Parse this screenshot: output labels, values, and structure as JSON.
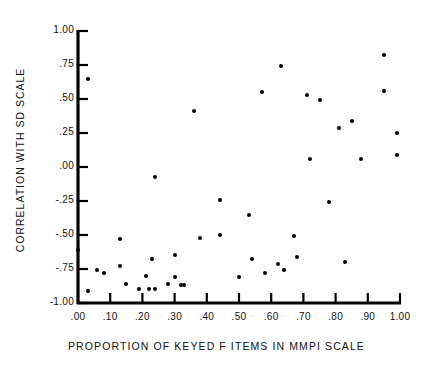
{
  "chart_data": {
    "type": "scatter",
    "title": "",
    "subtitle": "",
    "xlabel": "PROPORTION OF KEYED F ITEMS IN MMPI SCALE",
    "ylabel": "CORRELATION WITH SD SCALE",
    "xlim": [
      0.0,
      1.0
    ],
    "ylim": [
      -1.0,
      1.0
    ],
    "grid": false,
    "legend": null,
    "xticks": [
      0.0,
      0.1,
      0.2,
      0.3,
      0.4,
      0.5,
      0.6,
      0.7,
      0.8,
      0.9,
      1.0
    ],
    "xtick_labels": [
      ".00",
      ".10",
      ".20",
      ".30",
      ".40",
      ".50",
      ".60",
      ".70",
      ".80",
      ".90",
      "1.00"
    ],
    "yticks": [
      1.0,
      0.75,
      0.5,
      0.25,
      0.0,
      -0.25,
      -0.5,
      -0.75,
      -1.0
    ],
    "ytick_labels": [
      "1.00",
      ".75",
      ".50",
      ".25",
      ".00",
      "-.25",
      "-.50",
      "-.75",
      "-1.00"
    ],
    "marker": "filled-circle",
    "marker_color": "#000000",
    "points": [
      {
        "x": 0.0,
        "y": -0.61
      },
      {
        "x": 0.03,
        "y": 0.65
      },
      {
        "x": 0.03,
        "y": -0.91
      },
      {
        "x": 0.06,
        "y": -0.76
      },
      {
        "x": 0.08,
        "y": -0.78
      },
      {
        "x": 0.13,
        "y": -0.53
      },
      {
        "x": 0.13,
        "y": -0.73
      },
      {
        "x": 0.15,
        "y": -0.86
      },
      {
        "x": 0.19,
        "y": -0.9
      },
      {
        "x": 0.21,
        "y": -0.8
      },
      {
        "x": 0.22,
        "y": -0.9
      },
      {
        "x": 0.23,
        "y": -0.68
      },
      {
        "x": 0.24,
        "y": -0.9
      },
      {
        "x": 0.24,
        "y": -0.07
      },
      {
        "x": 0.28,
        "y": -0.86
      },
      {
        "x": 0.3,
        "y": -0.81
      },
      {
        "x": 0.3,
        "y": -0.65
      },
      {
        "x": 0.32,
        "y": -0.87
      },
      {
        "x": 0.33,
        "y": -0.87
      },
      {
        "x": 0.36,
        "y": 0.41
      },
      {
        "x": 0.38,
        "y": -0.52
      },
      {
        "x": 0.44,
        "y": -0.24
      },
      {
        "x": 0.44,
        "y": -0.5
      },
      {
        "x": 0.5,
        "y": -0.81
      },
      {
        "x": 0.53,
        "y": -0.35
      },
      {
        "x": 0.54,
        "y": -0.68
      },
      {
        "x": 0.57,
        "y": 0.55
      },
      {
        "x": 0.58,
        "y": -0.78
      },
      {
        "x": 0.62,
        "y": -0.71
      },
      {
        "x": 0.63,
        "y": 0.74
      },
      {
        "x": 0.64,
        "y": -0.76
      },
      {
        "x": 0.67,
        "y": -0.51
      },
      {
        "x": 0.68,
        "y": -0.66
      },
      {
        "x": 0.71,
        "y": 0.53
      },
      {
        "x": 0.72,
        "y": 0.06
      },
      {
        "x": 0.75,
        "y": 0.49
      },
      {
        "x": 0.78,
        "y": -0.26
      },
      {
        "x": 0.81,
        "y": 0.29
      },
      {
        "x": 0.83,
        "y": -0.7
      },
      {
        "x": 0.85,
        "y": 0.34
      },
      {
        "x": 0.88,
        "y": 0.06
      },
      {
        "x": 0.95,
        "y": 0.82
      },
      {
        "x": 0.95,
        "y": 0.56
      },
      {
        "x": 0.99,
        "y": 0.25
      },
      {
        "x": 0.99,
        "y": 0.09
      }
    ]
  },
  "axis": {
    "x_label": "PROPORTION OF KEYED F ITEMS IN MMPI SCALE",
    "y_label": "CORRELATION WITH SD SCALE"
  }
}
